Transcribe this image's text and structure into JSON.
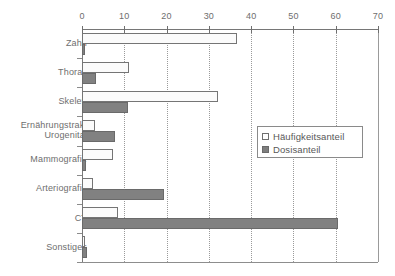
{
  "chart_data": {
    "type": "bar",
    "orientation": "horizontal",
    "title": "",
    "subtitle": "",
    "xlabel": "",
    "ylabel": "",
    "xlim": [
      0,
      70
    ],
    "xticks": [
      0,
      10,
      20,
      30,
      40,
      50,
      60,
      70
    ],
    "xtick_labels": [
      "0",
      "10",
      "20",
      "30",
      "40",
      "50",
      "60",
      "70"
    ],
    "grid": "vertical-dotted",
    "legend_position": "center-right",
    "categories": [
      "Zahn",
      "Thorax",
      "Skelett",
      "Ernährungstrakt Urogenital",
      "Mammografie",
      "Arteriografie",
      "CT",
      "Sonstiges"
    ],
    "category_lines": [
      [
        "Zahn"
      ],
      [
        "Thorax"
      ],
      [
        "Skelett"
      ],
      [
        "Ernährungstrakt",
        "Urogenital"
      ],
      [
        "Mammografie"
      ],
      [
        "Arteriografie"
      ],
      [
        "CT"
      ],
      [
        "Sonstiges"
      ]
    ],
    "series": [
      {
        "name": "Häufigkeitsanteil",
        "color": "#fbfbfb",
        "edge_color": "#757575",
        "values": [
          36.6,
          11.0,
          32.1,
          3.1,
          7.3,
          2.6,
          8.6,
          0.6
        ]
      },
      {
        "name": "Dosisanteil",
        "color": "#818181",
        "edge_color": "#6a6a6a",
        "values": [
          0.7,
          3.4,
          10.8,
          7.8,
          1.0,
          19.4,
          60.5,
          1.1
        ]
      }
    ]
  },
  "legend": {
    "items": [
      {
        "label": "Häufigkeitsanteil",
        "swatch": "open-square-icon"
      },
      {
        "label": "Dosisanteil",
        "swatch": "filled-square-icon"
      }
    ]
  },
  "colors": {
    "bar_fill_light": "#fbfbfb",
    "bar_fill_dark": "#818181",
    "axis": "#767676",
    "grid": "#9a9a9a",
    "text": "#6e6e6e",
    "background": "#ffffff"
  }
}
